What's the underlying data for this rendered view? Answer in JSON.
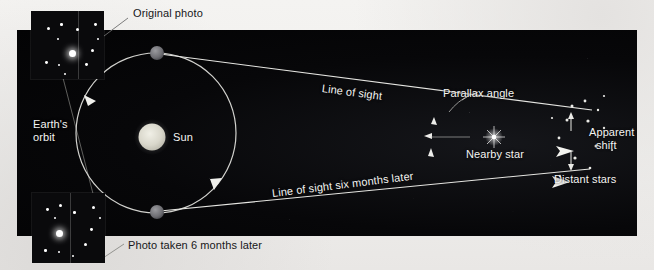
{
  "figure": {
    "background_color": "#f1efed",
    "field_color": "#050506",
    "label_light_color": "#f4f4f2",
    "label_dark_color": "#17171a"
  },
  "labels": {
    "original_photo": "Original photo",
    "photo_six_months": "Photo taken 6 months later",
    "earths_orbit_line1": "Earth's",
    "earths_orbit_line2": "orbit",
    "sun": "Sun",
    "line_of_sight": "Line of sight",
    "line_of_sight_six_months": "Line of sight six months later",
    "parallax_angle": "Parallax angle",
    "nearby_star": "Nearby star",
    "distant_stars": "Distant stars",
    "apparent_shift_line1": "Apparent",
    "apparent_shift_line2": "shift"
  },
  "objects": {
    "sun": {
      "name": "sun-disc",
      "cx": 152,
      "cy": 137,
      "r": 14,
      "color": "#d8d6cc"
    },
    "earth_top": {
      "name": "earth-position-1",
      "cx": 157,
      "cy": 53,
      "r": 7,
      "color": "#7a7a7e"
    },
    "earth_bottom": {
      "name": "earth-position-2",
      "cx": 157,
      "cy": 212,
      "r": 7,
      "color": "#6e6e73"
    },
    "orbit": {
      "name": "earth-orbit-ellipse",
      "cx": 156,
      "cy": 133,
      "rx": 80,
      "ry": 80,
      "stroke": "#cfcfcb"
    },
    "nearby_star": {
      "name": "nearby-star",
      "cx": 494,
      "cy": 137,
      "color": "#ffffff"
    }
  },
  "sight_lines": [
    {
      "name": "line-of-sight",
      "x1": 163,
      "y1": 54,
      "x2": 494,
      "y2": 137,
      "extends_to_x": 592,
      "extends_to_y": 111
    },
    {
      "name": "line-of-sight-six-months",
      "x1": 163,
      "y1": 211,
      "x2": 494,
      "y2": 137,
      "extends_to_x": 590,
      "extends_to_y": 168
    }
  ],
  "photos": {
    "top": {
      "name": "original-photo-inset",
      "stars": [
        {
          "x": 16,
          "y": 16,
          "s": 3.0
        },
        {
          "x": 29,
          "y": 12,
          "s": 2.6
        },
        {
          "x": 45,
          "y": 17,
          "s": 3.4
        },
        {
          "x": 63,
          "y": 12,
          "s": 2.8
        },
        {
          "x": 26,
          "y": 27,
          "s": 2.4
        },
        {
          "x": 41,
          "y": 42,
          "s": 6.5
        },
        {
          "x": 60,
          "y": 38,
          "s": 3.2
        },
        {
          "x": 54,
          "y": 52,
          "s": 2.8
        },
        {
          "x": 14,
          "y": 50,
          "s": 2.8
        },
        {
          "x": 27,
          "y": 53,
          "s": 2.2
        },
        {
          "x": 33,
          "y": 63,
          "s": 2.2
        },
        {
          "x": 66,
          "y": 27,
          "s": 2.0
        }
      ],
      "divider_x": 47
    },
    "bottom": {
      "name": "photo-six-months-later-inset",
      "stars": [
        {
          "x": 14,
          "y": 15,
          "s": 2.8
        },
        {
          "x": 27,
          "y": 11,
          "s": 3.0
        },
        {
          "x": 41,
          "y": 18,
          "s": 2.6
        },
        {
          "x": 60,
          "y": 13,
          "s": 3.2
        },
        {
          "x": 22,
          "y": 24,
          "s": 2.4
        },
        {
          "x": 27,
          "y": 40,
          "s": 6.5
        },
        {
          "x": 58,
          "y": 35,
          "s": 2.8
        },
        {
          "x": 52,
          "y": 50,
          "s": 3.2
        },
        {
          "x": 12,
          "y": 56,
          "s": 2.6
        },
        {
          "x": 26,
          "y": 58,
          "s": 2.4
        },
        {
          "x": 40,
          "y": 62,
          "s": 2.0
        },
        {
          "x": 67,
          "y": 24,
          "s": 2.2
        }
      ],
      "divider_x": 38
    }
  },
  "distant_stars": {
    "name": "distant-star-cluster",
    "stars": [
      {
        "x": 572,
        "y": 106,
        "s": 2.6
      },
      {
        "x": 585,
        "y": 101,
        "s": 2.4
      },
      {
        "x": 598,
        "y": 110,
        "s": 2.2
      },
      {
        "x": 567,
        "y": 120,
        "s": 2.6
      },
      {
        "x": 588,
        "y": 121,
        "s": 2.8
      },
      {
        "x": 604,
        "y": 128,
        "s": 2.2
      },
      {
        "x": 570,
        "y": 138,
        "s": 2.4
      },
      {
        "x": 596,
        "y": 146,
        "s": 2.6
      },
      {
        "x": 575,
        "y": 158,
        "s": 2.8
      },
      {
        "x": 590,
        "y": 166,
        "s": 2.4
      },
      {
        "x": 566,
        "y": 175,
        "s": 2.2
      },
      {
        "x": 604,
        "y": 96,
        "s": 2.0
      }
    ]
  },
  "annotations": {
    "parallax_arc": {
      "name": "parallax-angle-arc",
      "cx": 494,
      "cy": 137,
      "r": 48
    },
    "apparent_shift_arrow": {
      "name": "apparent-shift-double-arrow",
      "x": 571,
      "y_top": 113,
      "y_bottom": 163
    }
  }
}
